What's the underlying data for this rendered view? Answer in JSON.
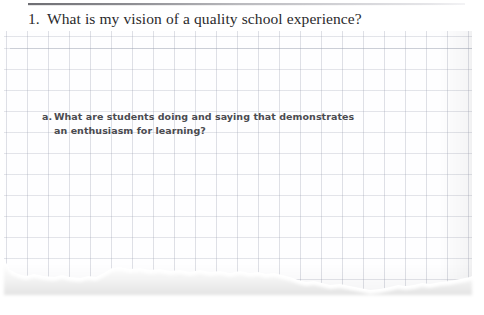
{
  "document": {
    "type": "worksheet-scan",
    "background_color": "#ffffff",
    "paper": {
      "kind": "torn-graph-paper",
      "grid_size_px": 21,
      "grid_line_color": "#969bac",
      "paper_color": "#fefeff"
    },
    "rule": {
      "name": "top-divider-rule",
      "color_start": "#6e6e73",
      "color_end": "#f3f3f5"
    }
  },
  "question": {
    "number": "1.",
    "text": "What is my vision of a quality school experience?",
    "color": "#2a2a2c"
  },
  "subquestion": {
    "letter": "a.",
    "line1": "What are students doing and saying that demonstrates",
    "line2": "an enthusiasm for learning?",
    "text": "What are students doing and saying that demonstrates an enthusiasm for learning?",
    "color": "#4b4b50"
  }
}
